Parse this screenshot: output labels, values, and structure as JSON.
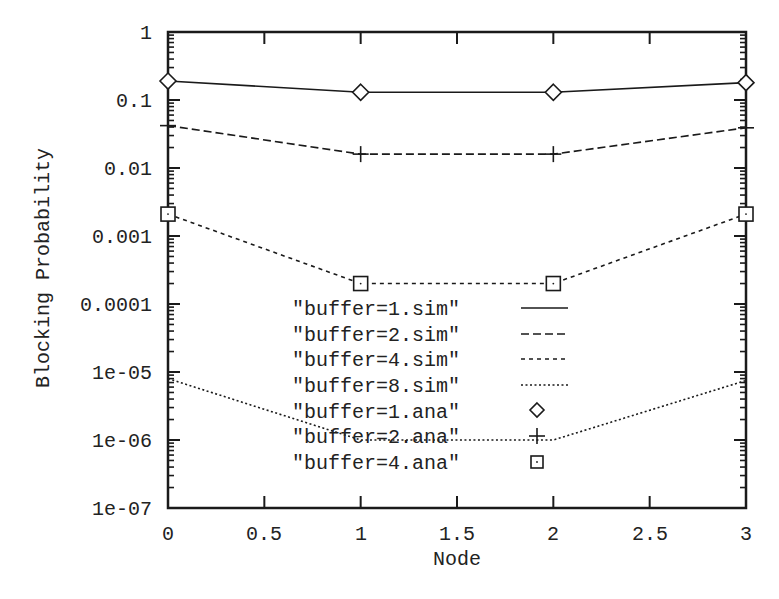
{
  "chart_data": {
    "type": "line",
    "title": "",
    "xlabel": "Node",
    "ylabel": "Blocking Probability",
    "yscale": "log",
    "xlim": [
      0,
      3
    ],
    "ylim": [
      1e-07,
      1
    ],
    "grid": false,
    "legend_position": "inside-center-bottom",
    "x_ticks": [
      "0",
      "0.5",
      "1",
      "1.5",
      "2",
      "2.5",
      "3"
    ],
    "y_ticks": [
      "1",
      "0.1",
      "0.01",
      "0.001",
      "0.0001",
      "1e-05",
      "1e-06",
      "1e-07"
    ],
    "x": [
      0,
      1,
      2,
      3
    ],
    "series": [
      {
        "name": "\"buffer=1.sim\"",
        "style": "solid",
        "values": [
          0.19,
          0.13,
          0.13,
          0.18
        ]
      },
      {
        "name": "\"buffer=2.sim\"",
        "style": "dashed",
        "values": [
          0.042,
          0.016,
          0.016,
          0.039
        ]
      },
      {
        "name": "\"buffer=4.sim\"",
        "style": "short-dashed",
        "values": [
          0.0021,
          0.0002,
          0.0002,
          0.0021
        ]
      },
      {
        "name": "\"buffer=8.sim\"",
        "style": "dotted",
        "values": [
          8e-06,
          1e-06,
          1e-06,
          7.5e-06
        ]
      },
      {
        "name": "\"buffer=1.ana\"",
        "style": "marker-diamond",
        "values": [
          0.19,
          0.13,
          0.13,
          0.18
        ]
      },
      {
        "name": "\"buffer=2.ana\"",
        "style": "marker-plus",
        "values": [
          0.042,
          0.016,
          0.016,
          0.039
        ]
      },
      {
        "name": "\"buffer=4.ana\"",
        "style": "marker-square",
        "values": [
          0.0021,
          0.0002,
          0.0002,
          0.0021
        ]
      }
    ]
  },
  "legend": {
    "items": [
      {
        "label": "\"buffer=1.sim\""
      },
      {
        "label": "\"buffer=2.sim\""
      },
      {
        "label": "\"buffer=4.sim\""
      },
      {
        "label": "\"buffer=8.sim\""
      },
      {
        "label": "\"buffer=1.ana\""
      },
      {
        "label": "\"buffer=2.ana\""
      },
      {
        "label": "\"buffer=4.ana\""
      }
    ]
  },
  "axes": {
    "xlabel": "Node",
    "ylabel": "Blocking Probability",
    "x_ticks": [
      "0",
      "0.5",
      "1",
      "1.5",
      "2",
      "2.5",
      "3"
    ],
    "y_ticks": [
      "1",
      "0.1",
      "0.01",
      "0.001",
      "0.0001",
      "1e-05",
      "1e-06",
      "1e-07"
    ]
  },
  "colors": {
    "ink": "#1a1a1a",
    "background": "#ffffff"
  }
}
